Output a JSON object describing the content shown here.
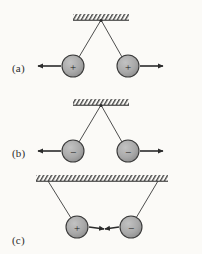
{
  "figure": {
    "background_color": "#fbfaf7",
    "ink_color": "#2b2b2b",
    "ball_fill_color": "#a9a9a9",
    "ball_stroke_color": "#3a3a3a",
    "hatch_color": "#4a4a4a",
    "panels": [
      {
        "id": "a",
        "label": "(a)",
        "description": "Two like positive charges repel, strings splay outward from a single ceiling point",
        "ceiling": {
          "x1": 73,
          "x2": 129,
          "y": 18,
          "attach_points": [
            101
          ]
        },
        "charges": [
          {
            "sign": "+",
            "cx": 73,
            "cy": 66,
            "r": 11,
            "force_arrow": "left"
          },
          {
            "sign": "+",
            "cx": 128,
            "cy": 66,
            "r": 11,
            "force_arrow": "right"
          }
        ],
        "label_pos": {
          "x": 12,
          "y": 62
        }
      },
      {
        "id": "b",
        "label": "(b)",
        "description": "Two like negative charges repel, strings splay outward from a single ceiling point",
        "ceiling": {
          "x1": 73,
          "x2": 129,
          "y": 103,
          "attach_points": [
            101
          ]
        },
        "charges": [
          {
            "sign": "−",
            "cx": 73,
            "cy": 151,
            "r": 11,
            "force_arrow": "left"
          },
          {
            "sign": "−",
            "cx": 128,
            "cy": 151,
            "r": 11,
            "force_arrow": "right"
          }
        ],
        "label_pos": {
          "x": 12,
          "y": 147
        }
      },
      {
        "id": "c",
        "label": "(c)",
        "description": "Opposite charges attract, strings hang inward from two separated ceiling points",
        "ceiling": {
          "x1": 36,
          "x2": 168,
          "y": 179,
          "attach_points": [
            48,
            158
          ]
        },
        "charges": [
          {
            "sign": "+",
            "cx": 77,
            "cy": 227,
            "r": 11,
            "force_arrow": "right"
          },
          {
            "sign": "−",
            "cx": 131,
            "cy": 227,
            "r": 11,
            "force_arrow": "left"
          }
        ],
        "label_pos": {
          "x": 12,
          "y": 234
        }
      }
    ],
    "symbols": {
      "positive": "+",
      "negative": "−",
      "ceiling_icon": "hatched-ceiling-icon",
      "string_icon": "string-line-icon",
      "force_icon": "force-arrow-icon"
    }
  }
}
